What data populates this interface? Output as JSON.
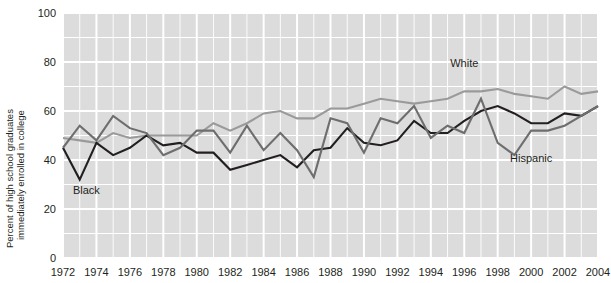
{
  "chart_data": {
    "type": "line",
    "title": "",
    "xlabel": "",
    "ylabel": "Percent of high school graduates immediately enrolled in college",
    "ylabel_line1": "Percent of high school graduates",
    "ylabel_line2": "immediately enrolled in college",
    "ylim": [
      0,
      100
    ],
    "xlim": [
      1972,
      2004
    ],
    "ytick_labels": [
      "0",
      "20",
      "40",
      "60",
      "80",
      "100"
    ],
    "ytick_values": [
      0,
      20,
      40,
      60,
      80,
      100
    ],
    "y_gridline_values": [
      0,
      10,
      20,
      30,
      40,
      50,
      60,
      70,
      80,
      90,
      100
    ],
    "xtick_labels": [
      "1972",
      "1974",
      "1976",
      "1978",
      "1980",
      "1982",
      "1984",
      "1986",
      "1988",
      "1990",
      "1992",
      "1994",
      "1996",
      "1998",
      "2000",
      "2002",
      "2004"
    ],
    "xtick_values": [
      1972,
      1974,
      1976,
      1978,
      1980,
      1982,
      1984,
      1986,
      1988,
      1990,
      1992,
      1994,
      1996,
      1998,
      2000,
      2002,
      2004
    ],
    "x": [
      1972,
      1973,
      1974,
      1975,
      1976,
      1977,
      1978,
      1979,
      1980,
      1981,
      1982,
      1983,
      1984,
      1985,
      1986,
      1987,
      1988,
      1989,
      1990,
      1991,
      1992,
      1993,
      1994,
      1995,
      1996,
      1997,
      1998,
      1999,
      2000,
      2001,
      2002,
      2003,
      2004
    ],
    "grid": true,
    "grid_color": "#ffffff",
    "plot_background": "#dcdcdc",
    "legend_position": "inline-annotations",
    "series": [
      {
        "name": "White",
        "color": "#9a9a9a",
        "label_x": 1996,
        "label_y": 78,
        "values": [
          49,
          48,
          47,
          51,
          49,
          50,
          50,
          50,
          50,
          55,
          52,
          55,
          59,
          60,
          57,
          57,
          61,
          61,
          63,
          65,
          64,
          63,
          64,
          65,
          68,
          68,
          69,
          67,
          66,
          65,
          70,
          67,
          68
        ]
      },
      {
        "name": "Black",
        "color": "#231f20",
        "label_x": 1973.4,
        "label_y": 26,
        "values": [
          45,
          32,
          47,
          42,
          45,
          50,
          46,
          47,
          43,
          43,
          36,
          38,
          40,
          42,
          37,
          44,
          45,
          53,
          47,
          46,
          48,
          56,
          51,
          51,
          56,
          60,
          62,
          59,
          55,
          55,
          59,
          58,
          62
        ]
      },
      {
        "name": "Hispanic",
        "color": "#6e6e6e",
        "label_x": 2000,
        "label_y": 39,
        "values": [
          45,
          54,
          48,
          58,
          53,
          51,
          42,
          45,
          52,
          52,
          43,
          54,
          44,
          51,
          44,
          33,
          57,
          55,
          43,
          57,
          55,
          62,
          49,
          54,
          51,
          65,
          47,
          42,
          52,
          52,
          54,
          58,
          62
        ]
      }
    ]
  }
}
